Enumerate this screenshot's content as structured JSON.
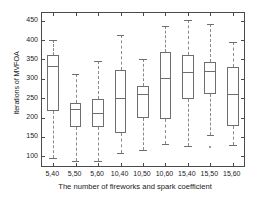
{
  "chart_data": {
    "type": "box",
    "title": "",
    "xlabel": "The number of fireworks and spark  coefficient",
    "ylabel": "Iterations of MVFOA",
    "categories": [
      "5,40",
      "5,50",
      "5,60",
      "10,40",
      "10,50",
      "10,60",
      "15,40",
      "15,50",
      "15,60"
    ],
    "ylim": [
      75,
      470
    ],
    "yticks": [
      100,
      150,
      200,
      250,
      300,
      350,
      400,
      450
    ],
    "ytick_labels": [
      "100",
      "150",
      "200",
      "250",
      "300",
      "350",
      "400",
      "450"
    ],
    "grid": false,
    "legend": null,
    "boxes": [
      {
        "category": "5,40",
        "whisker_low": 96,
        "q1": 218,
        "median": 334,
        "q3": 362,
        "whisker_high": 400,
        "outliers": []
      },
      {
        "category": "5,50",
        "whisker_low": 88,
        "q1": 175,
        "median": 222,
        "q3": 238,
        "whisker_high": 312,
        "outliers": []
      },
      {
        "category": "5,60",
        "whisker_low": 88,
        "q1": 176,
        "median": 212,
        "q3": 248,
        "whisker_high": 346,
        "outliers": []
      },
      {
        "category": "10,40",
        "whisker_low": 109,
        "q1": 159,
        "median": 250,
        "q3": 324,
        "whisker_high": 413,
        "outliers": []
      },
      {
        "category": "10,50",
        "whisker_low": 117,
        "q1": 200,
        "median": 261,
        "q3": 282,
        "whisker_high": 350,
        "outliers": []
      },
      {
        "category": "10,60",
        "whisker_low": 131,
        "q1": 196,
        "median": 302,
        "q3": 370,
        "whisker_high": 436,
        "outliers": []
      },
      {
        "category": "15,40",
        "whisker_low": 127,
        "q1": 249,
        "median": 317,
        "q3": 361,
        "whisker_high": 453,
        "outliers": []
      },
      {
        "category": "15,50",
        "whisker_low": 156,
        "q1": 261,
        "median": 321,
        "q3": 343,
        "whisker_high": 441,
        "outliers": [
          125
        ]
      },
      {
        "category": "15,60",
        "whisker_low": 128,
        "q1": 179,
        "median": 261,
        "q3": 331,
        "whisker_high": 395,
        "outliers": []
      }
    ]
  }
}
